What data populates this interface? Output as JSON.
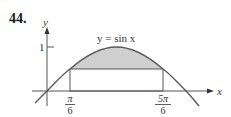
{
  "problem": {
    "number": "44."
  },
  "figure": {
    "curve_label": "y = sin x",
    "x_axis_label": "x",
    "y_axis_label": "y",
    "y_tick_label": "1",
    "x_ticks": [
      {
        "numerator": "π",
        "denominator": "6"
      },
      {
        "numerator": "5π",
        "denominator": "6"
      }
    ],
    "colors": {
      "curve": "#5a5a5a",
      "shading": "#cfcfcf",
      "axes": "#555555",
      "rectangle": "#555555"
    }
  }
}
